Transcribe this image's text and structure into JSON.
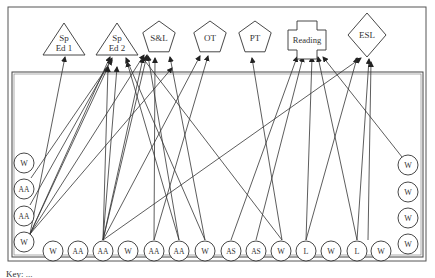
{
  "diagram": {
    "services": [
      {
        "id": "sped1",
        "label_lines": [
          "Sp",
          "Ed 1"
        ],
        "shape": "triangle",
        "cx": 64,
        "cy": 45
      },
      {
        "id": "sped2",
        "label_lines": [
          "Sp",
          "Ed 2"
        ],
        "shape": "triangle",
        "cx": 117,
        "cy": 45
      },
      {
        "id": "sl",
        "label_lines": [
          "S&L"
        ],
        "shape": "pentagon",
        "cx": 159,
        "cy": 38
      },
      {
        "id": "ot",
        "label_lines": [
          "OT"
        ],
        "shape": "pentagon",
        "cx": 210,
        "cy": 38
      },
      {
        "id": "pt",
        "label_lines": [
          "PT"
        ],
        "shape": "pentagon",
        "cx": 255,
        "cy": 38
      },
      {
        "id": "reading",
        "label_lines": [
          "Reading"
        ],
        "shape": "cross",
        "cx": 307,
        "cy": 40
      },
      {
        "id": "esl",
        "label_lines": [
          "ESL"
        ],
        "shape": "diamond",
        "cx": 367,
        "cy": 35
      }
    ],
    "students_left": [
      {
        "label": "W",
        "cx": 24,
        "cy": 163
      },
      {
        "label": "AA",
        "cx": 24,
        "cy": 189
      },
      {
        "label": "AA",
        "cx": 24,
        "cy": 216
      },
      {
        "label": "W",
        "cx": 24,
        "cy": 242
      }
    ],
    "students_bottom": [
      {
        "label": "W",
        "cx": 53,
        "cy": 251
      },
      {
        "label": "AA",
        "cx": 78,
        "cy": 251
      },
      {
        "label": "AA",
        "cx": 103,
        "cy": 251
      },
      {
        "label": "W",
        "cx": 128,
        "cy": 251
      },
      {
        "label": "AA",
        "cx": 154,
        "cy": 251
      },
      {
        "label": "AA",
        "cx": 179,
        "cy": 251
      },
      {
        "label": "W",
        "cx": 205,
        "cy": 251
      },
      {
        "label": "AS",
        "cx": 231,
        "cy": 251
      },
      {
        "label": "AS",
        "cx": 256,
        "cy": 251
      },
      {
        "label": "W",
        "cx": 281,
        "cy": 251
      },
      {
        "label": "L",
        "cx": 306,
        "cy": 251
      },
      {
        "label": "W",
        "cx": 331,
        "cy": 251
      },
      {
        "label": "L",
        "cx": 357,
        "cy": 251
      },
      {
        "label": "W",
        "cx": 381,
        "cy": 251
      }
    ],
    "students_right": [
      {
        "label": "W",
        "cx": 408,
        "cy": 165
      },
      {
        "label": "W",
        "cx": 408,
        "cy": 192
      },
      {
        "label": "W",
        "cx": 408,
        "cy": 218
      },
      {
        "label": "W",
        "cx": 408,
        "cy": 244
      }
    ],
    "arrows": [
      [
        30,
        234,
        65,
        57
      ],
      [
        30,
        234,
        108,
        67
      ],
      [
        30,
        234,
        110,
        57
      ],
      [
        30,
        234,
        144,
        55
      ],
      [
        30,
        234,
        172,
        68
      ],
      [
        31,
        178,
        112,
        60
      ],
      [
        30,
        205,
        112,
        58
      ],
      [
        103,
        240,
        108,
        67
      ],
      [
        103,
        240,
        117,
        67
      ],
      [
        103,
        240,
        143,
        58
      ],
      [
        103,
        240,
        147,
        55
      ],
      [
        103,
        240,
        200,
        56
      ],
      [
        154,
        240,
        155,
        58
      ],
      [
        154,
        240,
        208,
        56
      ],
      [
        179,
        240,
        127,
        62
      ],
      [
        179,
        240,
        148,
        56
      ],
      [
        205,
        240,
        126,
        58
      ],
      [
        205,
        240,
        170,
        57
      ],
      [
        231,
        240,
        297,
        57
      ],
      [
        256,
        240,
        303,
        57
      ],
      [
        282,
        240,
        142,
        57
      ],
      [
        282,
        240,
        252,
        58
      ],
      [
        306,
        240,
        312,
        57
      ],
      [
        306,
        240,
        357,
        58
      ],
      [
        357,
        240,
        318,
        57
      ],
      [
        357,
        240,
        369,
        59
      ],
      [
        368,
        240,
        371,
        62
      ],
      [
        402,
        157,
        323,
        57
      ],
      [
        103,
        240,
        361,
        58
      ]
    ]
  },
  "footer": {
    "caption_fragment": "Key: ..."
  }
}
